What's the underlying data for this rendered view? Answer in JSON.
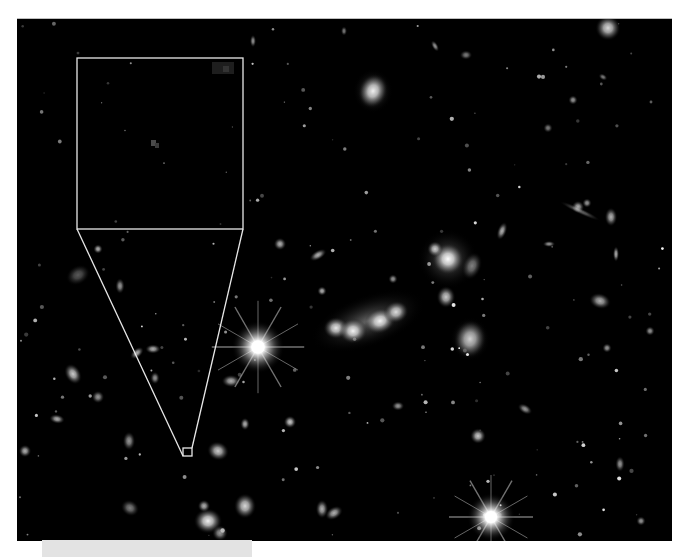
{
  "image": {
    "kind": "deep-field-astronomical-photo",
    "background": "#000000",
    "bounds": {
      "x": 17,
      "y": 18,
      "width": 655,
      "height": 522
    }
  },
  "overlay": {
    "stroke_color": "#e8e8e8",
    "inset_box": {
      "x": 77,
      "y": 58,
      "width": 166,
      "height": 171
    },
    "target_box": {
      "x": 183,
      "y": 448,
      "width": 9,
      "height": 8
    },
    "connector_lines": [
      {
        "from": [
          77,
          229
        ],
        "to": [
          183,
          456
        ]
      },
      {
        "from": [
          243,
          229
        ],
        "to": [
          192,
          448
        ]
      }
    ]
  },
  "caption_bar": {
    "color": "#e3e3e3",
    "x": 42,
    "y": 540,
    "width": 210,
    "height": 17
  },
  "features": {
    "bright_stars": [
      {
        "name": "diffraction-star-left",
        "x": 258,
        "y": 346,
        "r": 11
      },
      {
        "name": "diffraction-star-bottom",
        "x": 491,
        "y": 516,
        "r": 10
      }
    ],
    "galaxies": [
      {
        "x": 373,
        "y": 90,
        "rx": 9,
        "ry": 11,
        "rot": 20,
        "b": 0.9
      },
      {
        "x": 608,
        "y": 27,
        "rx": 8,
        "ry": 8,
        "rot": 0,
        "b": 0.85
      },
      {
        "x": 336,
        "y": 327,
        "rx": 8,
        "ry": 7,
        "rot": 0,
        "b": 0.9
      },
      {
        "x": 353,
        "y": 330,
        "rx": 9,
        "ry": 8,
        "rot": 0,
        "b": 0.95
      },
      {
        "x": 380,
        "y": 320,
        "rx": 10,
        "ry": 8,
        "rot": -20,
        "b": 0.95
      },
      {
        "x": 396,
        "y": 311,
        "rx": 8,
        "ry": 7,
        "rot": -20,
        "b": 0.85
      },
      {
        "x": 448,
        "y": 258,
        "rx": 10,
        "ry": 10,
        "rot": 0,
        "b": 1.0
      },
      {
        "x": 435,
        "y": 248,
        "rx": 5,
        "ry": 5,
        "rot": 0,
        "b": 0.8
      },
      {
        "x": 446,
        "y": 296,
        "rx": 6,
        "ry": 7,
        "rot": 0,
        "b": 0.8
      },
      {
        "x": 470,
        "y": 338,
        "rx": 10,
        "ry": 12,
        "rot": 10,
        "b": 0.7
      },
      {
        "x": 472,
        "y": 265,
        "rx": 6,
        "ry": 9,
        "rot": 20,
        "b": 0.5
      },
      {
        "x": 231,
        "y": 380,
        "rx": 6,
        "ry": 4,
        "rot": 0,
        "b": 0.7
      },
      {
        "x": 73,
        "y": 373,
        "rx": 5,
        "ry": 7,
        "rot": -30,
        "b": 0.8
      },
      {
        "x": 98,
        "y": 396,
        "rx": 4,
        "ry": 4,
        "rot": 0,
        "b": 0.6
      },
      {
        "x": 129,
        "y": 440,
        "rx": 4,
        "ry": 6,
        "rot": 0,
        "b": 0.6
      },
      {
        "x": 57,
        "y": 418,
        "rx": 5,
        "ry": 3,
        "rot": 10,
        "b": 0.7
      },
      {
        "x": 25,
        "y": 450,
        "rx": 4,
        "ry": 4,
        "rot": 0,
        "b": 0.7
      },
      {
        "x": 218,
        "y": 450,
        "rx": 7,
        "ry": 6,
        "rot": 20,
        "b": 0.8
      },
      {
        "x": 245,
        "y": 423,
        "rx": 3,
        "ry": 4,
        "rot": 0,
        "b": 0.7
      },
      {
        "x": 290,
        "y": 421,
        "rx": 4,
        "ry": 4,
        "rot": 0,
        "b": 0.8
      },
      {
        "x": 245,
        "y": 505,
        "rx": 7,
        "ry": 8,
        "rot": 0,
        "b": 0.85
      },
      {
        "x": 208,
        "y": 520,
        "rx": 9,
        "ry": 8,
        "rot": 0,
        "b": 0.95
      },
      {
        "x": 204,
        "y": 505,
        "rx": 4,
        "ry": 4,
        "rot": 0,
        "b": 0.7
      },
      {
        "x": 220,
        "y": 532,
        "rx": 5,
        "ry": 5,
        "rot": 0,
        "b": 0.6
      },
      {
        "x": 322,
        "y": 508,
        "rx": 4,
        "ry": 6,
        "rot": 0,
        "b": 0.7
      },
      {
        "x": 334,
        "y": 512,
        "rx": 6,
        "ry": 4,
        "rot": -30,
        "b": 0.7
      },
      {
        "x": 130,
        "y": 507,
        "rx": 6,
        "ry": 5,
        "rot": 30,
        "b": 0.5
      },
      {
        "x": 478,
        "y": 435,
        "rx": 5,
        "ry": 5,
        "rot": 0,
        "b": 0.8
      },
      {
        "x": 318,
        "y": 254,
        "rx": 6,
        "ry": 3,
        "rot": -30,
        "b": 0.7
      },
      {
        "x": 280,
        "y": 243,
        "rx": 4,
        "ry": 4,
        "rot": 0,
        "b": 0.7
      },
      {
        "x": 322,
        "y": 290,
        "rx": 3,
        "ry": 3,
        "rot": 0,
        "b": 0.7
      },
      {
        "x": 393,
        "y": 278,
        "rx": 3,
        "ry": 3,
        "rot": 0,
        "b": 0.6
      },
      {
        "x": 578,
        "y": 206,
        "rx": 4,
        "ry": 4,
        "rot": 0,
        "b": 0.7
      },
      {
        "x": 587,
        "y": 202,
        "rx": 3,
        "ry": 3,
        "rot": 0,
        "b": 0.6
      },
      {
        "x": 580,
        "y": 210,
        "rx": 14,
        "ry": 2,
        "rot": 25,
        "b": 0.4
      },
      {
        "x": 611,
        "y": 216,
        "rx": 4,
        "ry": 6,
        "rot": 0,
        "b": 0.7
      },
      {
        "x": 600,
        "y": 300,
        "rx": 7,
        "ry": 5,
        "rot": 15,
        "b": 0.7
      },
      {
        "x": 502,
        "y": 230,
        "rx": 3,
        "ry": 6,
        "rot": 20,
        "b": 0.7
      },
      {
        "x": 549,
        "y": 243,
        "rx": 4,
        "ry": 2,
        "rot": 0,
        "b": 0.6
      },
      {
        "x": 616,
        "y": 253,
        "rx": 2,
        "ry": 5,
        "rot": 0,
        "b": 0.7
      },
      {
        "x": 650,
        "y": 330,
        "rx": 3,
        "ry": 3,
        "rot": 0,
        "b": 0.6
      },
      {
        "x": 607,
        "y": 347,
        "rx": 3,
        "ry": 3,
        "rot": 0,
        "b": 0.6
      },
      {
        "x": 548,
        "y": 127,
        "rx": 3,
        "ry": 3,
        "rot": 0,
        "b": 0.5
      },
      {
        "x": 603,
        "y": 76,
        "rx": 3,
        "ry": 2,
        "rot": 30,
        "b": 0.5
      },
      {
        "x": 573,
        "y": 99,
        "rx": 3,
        "ry": 3,
        "rot": 0,
        "b": 0.6
      },
      {
        "x": 435,
        "y": 45,
        "rx": 2,
        "ry": 4,
        "rot": -30,
        "b": 0.6
      },
      {
        "x": 466,
        "y": 54,
        "rx": 4,
        "ry": 3,
        "rot": 0,
        "b": 0.5
      },
      {
        "x": 253,
        "y": 40,
        "rx": 2,
        "ry": 4,
        "rot": 0,
        "b": 0.6
      },
      {
        "x": 344,
        "y": 30,
        "rx": 2,
        "ry": 3,
        "rot": 0,
        "b": 0.5
      },
      {
        "x": 137,
        "y": 352,
        "rx": 5,
        "ry": 3,
        "rot": -40,
        "b": 0.7
      },
      {
        "x": 153,
        "y": 348,
        "rx": 5,
        "ry": 3,
        "rot": 0,
        "b": 0.7
      },
      {
        "x": 155,
        "y": 377,
        "rx": 3,
        "ry": 4,
        "rot": 0,
        "b": 0.6
      },
      {
        "x": 120,
        "y": 285,
        "rx": 3,
        "ry": 5,
        "rot": 0,
        "b": 0.6
      },
      {
        "x": 98,
        "y": 248,
        "rx": 3,
        "ry": 3,
        "rot": 0,
        "b": 0.7
      },
      {
        "x": 78,
        "y": 274,
        "rx": 8,
        "ry": 6,
        "rot": -30,
        "b": 0.35
      },
      {
        "x": 641,
        "y": 520,
        "rx": 3,
        "ry": 3,
        "rot": 0,
        "b": 0.6
      },
      {
        "x": 620,
        "y": 463,
        "rx": 3,
        "ry": 5,
        "rot": 0,
        "b": 0.6
      },
      {
        "x": 525,
        "y": 408,
        "rx": 5,
        "ry": 3,
        "rot": 30,
        "b": 0.6
      },
      {
        "x": 398,
        "y": 405,
        "rx": 4,
        "ry": 3,
        "rot": 0,
        "b": 0.6
      }
    ]
  }
}
